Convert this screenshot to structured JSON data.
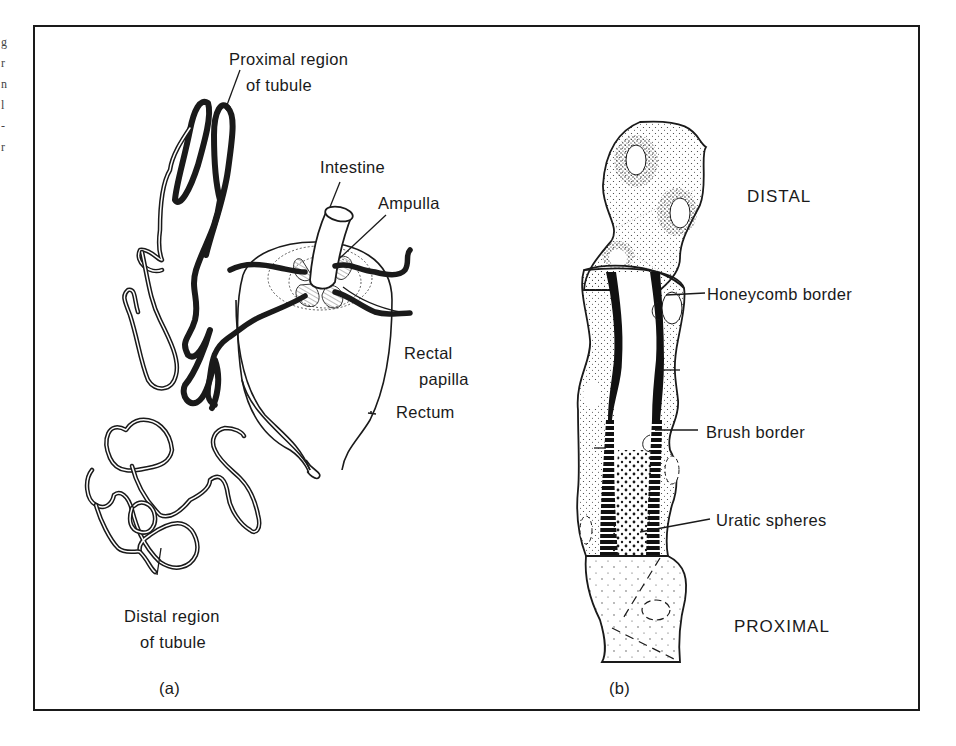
{
  "figure": {
    "panel_a": {
      "caption": "(a)",
      "labels": {
        "proximal_line1": "Proximal region",
        "proximal_line2": "of tubule",
        "intestine": "Intestine",
        "ampulla": "Ampulla",
        "rectal_line1": "Rectal",
        "rectal_line2": "papilla",
        "rectum": "Rectum",
        "distal_line1": "Distal region",
        "distal_line2": "of tubule"
      }
    },
    "panel_b": {
      "caption": "(b)",
      "labels": {
        "distal": "DISTAL",
        "honeycomb": "Honeycomb border",
        "brush": "Brush border",
        "uratic": "Uratic spheres",
        "proximal": "PROXIMAL"
      }
    },
    "margin_fragments": [
      "g",
      "r",
      "n",
      "l",
      "-",
      "r"
    ],
    "colors": {
      "ink": "#1a1a1a",
      "paper": "#ffffff"
    }
  }
}
